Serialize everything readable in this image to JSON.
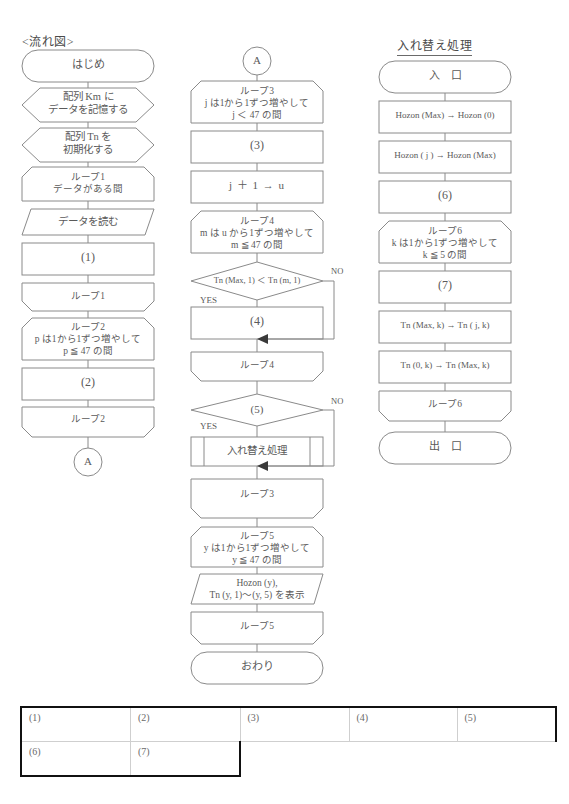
{
  "columns": {
    "left_title": "<流れ図>",
    "right_title": "入れ替え処理"
  },
  "left_flow": [
    {
      "id": "start",
      "shape": "terminator",
      "text": "はじめ"
    },
    {
      "id": "km-store",
      "shape": "preparation",
      "text": "配列 Km に\nデータを記憶する"
    },
    {
      "id": "tn-init",
      "shape": "preparation",
      "text": "配列 Tn を\n初期化する"
    },
    {
      "id": "loop1-start",
      "shape": "loop-start",
      "text": "ループ1\nデータがある間"
    },
    {
      "id": "read-data",
      "shape": "io",
      "text": "データを読む"
    },
    {
      "id": "blank1",
      "shape": "process",
      "text": "(1)"
    },
    {
      "id": "loop1-end",
      "shape": "loop-end",
      "text": "ループ1"
    },
    {
      "id": "loop2-start",
      "shape": "loop-start",
      "text": "ループ2\np は1から1ずつ増やして\np ≦ 47 の間"
    },
    {
      "id": "blank2",
      "shape": "process",
      "text": "(2)"
    },
    {
      "id": "loop2-end",
      "shape": "loop-end",
      "text": "ループ2"
    },
    {
      "id": "conn-a-out",
      "shape": "connector",
      "text": "A"
    }
  ],
  "middle_flow": [
    {
      "id": "conn-a-in",
      "shape": "connector",
      "text": "A"
    },
    {
      "id": "loop3-start",
      "shape": "loop-start",
      "text": "ループ3\nj は1から1ずつ増やして\nj ＜ 47 の間"
    },
    {
      "id": "blank3",
      "shape": "process",
      "text": "(3)"
    },
    {
      "id": "j-plus",
      "shape": "process",
      "text": "j ＋ 1 → u"
    },
    {
      "id": "loop4-start",
      "shape": "loop-start",
      "text": "ループ4\nm は u から1ずつ増やして\nm ≦ 47 の間"
    },
    {
      "id": "cmp",
      "shape": "decision",
      "text": "Tn (Max, 1) ＜ Tn (m, 1)",
      "yes": "YES",
      "no": "NO"
    },
    {
      "id": "blank4",
      "shape": "process",
      "text": "(4)"
    },
    {
      "id": "loop4-end",
      "shape": "loop-end",
      "text": "ループ4"
    },
    {
      "id": "blank5",
      "shape": "decision",
      "text": "(5)",
      "yes": "YES",
      "no": "NO"
    },
    {
      "id": "swap-call",
      "shape": "predefined",
      "text": "入れ替え処理"
    },
    {
      "id": "loop3-end",
      "shape": "loop-end",
      "text": "ループ3"
    },
    {
      "id": "loop5-start",
      "shape": "loop-start",
      "text": "ループ5\ny は1から1ずつ増やして\ny ≦ 47 の間"
    },
    {
      "id": "display",
      "shape": "io",
      "text": "Hozon (y),\nTn (y, 1)〜(y, 5) を表示"
    },
    {
      "id": "loop5-end",
      "shape": "loop-end",
      "text": "ループ5"
    },
    {
      "id": "end",
      "shape": "terminator",
      "text": "おわり"
    }
  ],
  "right_flow": [
    {
      "id": "sub-entry",
      "shape": "terminator",
      "text": "入　口"
    },
    {
      "id": "hz1",
      "shape": "process",
      "text": "Hozon (Max)  →  Hozon (0)"
    },
    {
      "id": "hz2",
      "shape": "process",
      "text": "Hozon ( j )  →  Hozon (Max)"
    },
    {
      "id": "blank6",
      "shape": "process",
      "text": "(6)"
    },
    {
      "id": "loop6-start",
      "shape": "loop-start",
      "text": "ループ6\nk は1から1ずつ増やして\nk ≦ 5 の間"
    },
    {
      "id": "blank7",
      "shape": "process",
      "text": "(7)"
    },
    {
      "id": "tn1",
      "shape": "process",
      "text": "Tn (Max, k)  →  Tn ( j, k)"
    },
    {
      "id": "tn2",
      "shape": "process",
      "text": "Tn (0, k)  →  Tn (Max, k)"
    },
    {
      "id": "loop6-end",
      "shape": "loop-end",
      "text": "ループ6"
    },
    {
      "id": "sub-exit",
      "shape": "terminator",
      "text": "出　口"
    }
  ],
  "answer_table": {
    "row1": [
      "(1)",
      "(2)",
      "(3)",
      "(4)",
      "(5)"
    ],
    "row2": [
      "(6)",
      "(7)"
    ]
  },
  "colors": {
    "stroke": "#8a8a8a",
    "text": "#5a5a5a",
    "table_border": "#111111",
    "table_grid": "#cfcfcf"
  }
}
